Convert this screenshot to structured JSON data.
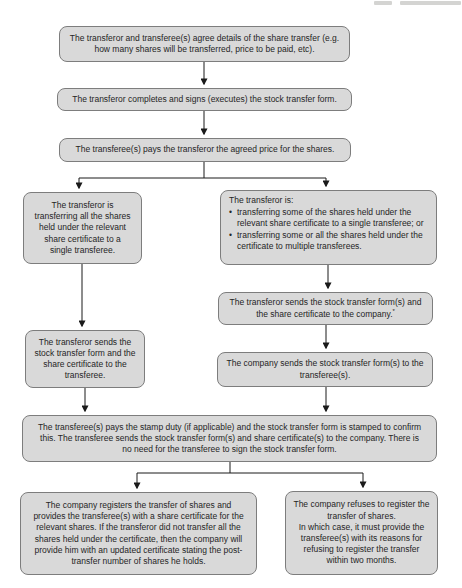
{
  "colors": {
    "box_fill": "#d9d9d9",
    "box_border": "#7d7d7d",
    "text": "#252525",
    "arrow": "#1a1a1a",
    "background": "#ffffff"
  },
  "page_header": {
    "note": "truncated faint running-header text, cut off at top edge"
  },
  "flowchart": {
    "bullet_char": "•",
    "step1": "The transferor and transferee(s) agree details of the share transfer (e.g. how many shares will be transferred, price to be paid, etc).",
    "step2": "The transferor completes and signs (executes) the stock transfer form.",
    "step3": "The transferee(s) pays the transferor the agreed price for the shares.",
    "branch_left": "The transferor is transferring all the shares held under the relevant share certificate to a single transferee.",
    "branch_right": {
      "intro": "The transferor is:",
      "bullets": [
        "transferring some of the shares held under the relevant share certificate to a single transferee; or",
        "transferring some or all the shares held under the certificate to multiple transferees."
      ]
    },
    "right_step1": {
      "text": "The transferor sends the stock transfer form(s) and the share certificate to the company.",
      "footnote_marker": "*"
    },
    "right_step2": "The company sends the stock transfer form(s) to the transferee(s).",
    "left_step1": "The transferor sends the stock transfer form and the share certificate to the transferee.",
    "merge_step": "The transferee(s) pays the stamp duty (if applicable) and the stock transfer form is stamped to confirm this. The transferee sends the stock transfer form(s) and share certificate(s) to the company. There is no need for the transferee to sign the stock transfer form.",
    "outcome_left": "The company registers the transfer of shares and provides the transferee(s) with a share certificate for the relevant shares. If the transferor did not transfer all the shares held under the certificate, then the company will provide him with an updated certificate stating the post-transfer number of shares he holds.",
    "outcome_right": "The company refuses to register the transfer of shares.\nIn which case, it must provide the transferee(s) with its reasons for refusing to register the transfer within two months."
  }
}
